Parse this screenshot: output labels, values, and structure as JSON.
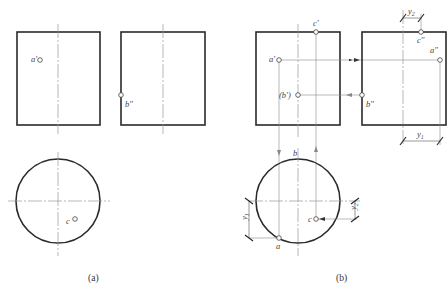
{
  "figure_a": {
    "caption": "(a)",
    "front_view": {
      "point_label": "a'"
    },
    "side_view": {
      "point_label": "b''"
    },
    "top_view": {
      "point_label": "c"
    }
  },
  "figure_b": {
    "caption": "(b)",
    "front_view": {
      "labels": {
        "a": "a'",
        "b": "(b')",
        "c": "c'"
      }
    },
    "side_view": {
      "labels": {
        "a": "a''",
        "b": "b''",
        "c": "c''"
      }
    },
    "top_view": {
      "labels": {
        "a": "a",
        "b": "b",
        "c": "c"
      }
    },
    "dimensions": {
      "y1": "y",
      "y1_sub": "1",
      "y2": "y",
      "y2_sub": "2"
    }
  },
  "colors": {
    "outline": "#2a2a2a",
    "centerline": "#9a9a9a",
    "projection": "#8a8a8a"
  }
}
